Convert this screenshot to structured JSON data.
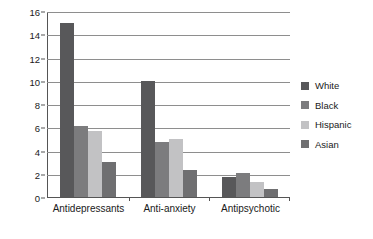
{
  "chart_data": {
    "type": "bar",
    "title": "",
    "xlabel": "",
    "ylabel": "U.S adults reporting use (%)",
    "categories": [
      "Antidepressants",
      "Anti-anxiety",
      "Antipsychotic"
    ],
    "series": [
      {
        "name": "White",
        "color": "#58585a",
        "values": [
          15.0,
          10.0,
          1.75
        ]
      },
      {
        "name": "Black",
        "color": "#7c7c7e",
        "values": [
          6.1,
          4.7,
          2.05
        ]
      },
      {
        "name": "Hispanic",
        "color": "#c2c2c4",
        "values": [
          5.7,
          5.0,
          1.3
        ]
      },
      {
        "name": "Asian",
        "color": "#6f6f71",
        "values": [
          3.0,
          2.3,
          0.65
        ]
      }
    ],
    "ylim": [
      0,
      16
    ],
    "yticks": [
      0,
      2,
      4,
      6,
      8,
      10,
      12,
      14,
      16
    ],
    "ytick_labels": [
      "0",
      "2",
      "4",
      "6",
      "8",
      "10",
      "12",
      "14",
      "16"
    ],
    "grid": true,
    "legend_position": "right",
    "legend_entries": [
      "White",
      "Black",
      "Hispanic",
      "Asian"
    ]
  },
  "colors": {
    "background": "#ffffff",
    "axis": "#555555",
    "gridline": "#8e8e8e",
    "text": "#1a1a1a"
  }
}
